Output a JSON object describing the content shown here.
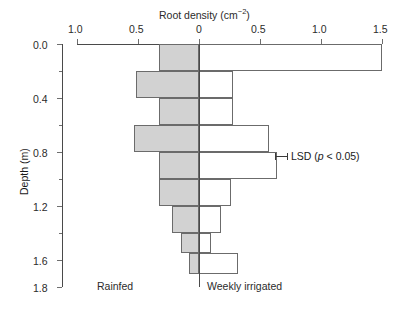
{
  "chart_data": {
    "type": "bar",
    "orientation": "horizontal-diverging",
    "xlabel": "Root density (cm-2)",
    "ylabel": "Depth (m)",
    "xlim": [
      -1.0,
      1.5
    ],
    "ylim": [
      0.0,
      1.8
    ],
    "x_tick_labels": [
      "1.0",
      "0.5",
      "0",
      "0.5",
      "1.0",
      "1.5"
    ],
    "x_tick_values": [
      -1.0,
      -0.5,
      0.0,
      0.5,
      1.0,
      1.5
    ],
    "y_tick_labels": [
      "0.0",
      "0.4",
      "0.8",
      "1.2",
      "1.6",
      "1.8"
    ],
    "y_tick_values": [
      0.0,
      0.4,
      0.8,
      1.2,
      1.6,
      1.8
    ],
    "y_minor_ticks": [
      0.2,
      0.6,
      1.0,
      1.4
    ],
    "grid": false,
    "legend_position": "inline-bottom",
    "depth_bins": [
      [
        0.0,
        0.2
      ],
      [
        0.2,
        0.4
      ],
      [
        0.4,
        0.6
      ],
      [
        0.6,
        0.8
      ],
      [
        0.8,
        1.0
      ],
      [
        1.0,
        1.2
      ],
      [
        1.2,
        1.4
      ],
      [
        1.4,
        1.55
      ],
      [
        1.55,
        1.7
      ]
    ],
    "series": [
      {
        "name": "Rainfed",
        "side": "left",
        "color": "#d2d2d2",
        "values": [
          0.33,
          0.52,
          0.33,
          0.53,
          0.33,
          0.33,
          0.22,
          0.15,
          0.08
        ]
      },
      {
        "name": "Weekly irrigated",
        "side": "right",
        "color": "#ffffff",
        "values": [
          1.5,
          0.28,
          0.28,
          0.57,
          0.64,
          0.26,
          0.18,
          0.1,
          0.32
        ]
      }
    ],
    "annotations": [
      {
        "name": "lsd",
        "text": "LSD (p < 0.05)",
        "depth": 0.83,
        "value": 0.62,
        "bar_width": 0.1
      }
    ],
    "labels": {
      "left_series": "Rainfed",
      "right_series": "Weekly irrigated"
    }
  },
  "axis": {
    "x_title_main": "Root density (cm",
    "x_title_sup": "−2",
    "x_title_tail": ")",
    "y_title": "Depth (m)"
  },
  "lsd": {
    "prefix": "LSD (",
    "p_italic": "p",
    "suffix": " < 0.05)"
  }
}
